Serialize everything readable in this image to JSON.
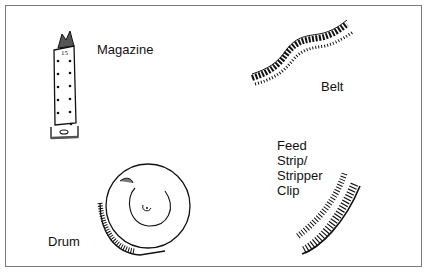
{
  "diagram": {
    "type": "ammunition-feeding-devices",
    "items": [
      {
        "id": "magazine",
        "label": "Magazine",
        "magazine_marking": "15"
      },
      {
        "id": "belt",
        "label": "Belt"
      },
      {
        "id": "feed-strip",
        "label_lines": [
          "Feed",
          "Strip/",
          "Stripper",
          "Clip"
        ]
      },
      {
        "id": "drum",
        "label": "Drum"
      }
    ],
    "colors": {
      "border": "#7a7a7a",
      "ink": "#111111",
      "background": "#ffffff"
    }
  }
}
